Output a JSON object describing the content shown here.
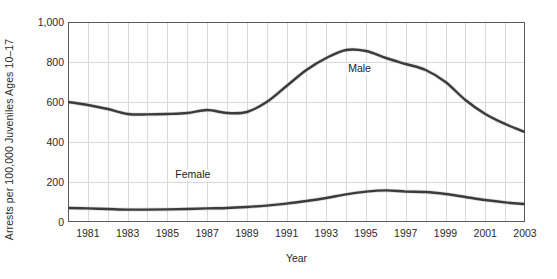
{
  "chart_data": {
    "type": "line",
    "title": "",
    "xlabel": "Year",
    "ylabel": "Arrests per 100,000 Juveniles Ages 10–17",
    "xlim": [
      1980,
      2003
    ],
    "ylim": [
      0,
      1000
    ],
    "yticks": [
      "0",
      "200",
      "400",
      "600",
      "800",
      "1,000"
    ],
    "ytick_values": [
      0,
      200,
      400,
      600,
      800,
      1000
    ],
    "xticks": [
      "1981",
      "1983",
      "1985",
      "1987",
      "1989",
      "1991",
      "1993",
      "1995",
      "1997",
      "1999",
      "2001",
      "2003"
    ],
    "xtick_values": [
      1981,
      1983,
      1985,
      1987,
      1989,
      1991,
      1993,
      1995,
      1997,
      1999,
      2001,
      2003
    ],
    "grid": true,
    "grid_color": "#d9d9dd",
    "line_color": "#3b3b3b",
    "legend_position": "inline-annotations",
    "x": [
      1980,
      1981,
      1982,
      1983,
      1984,
      1985,
      1986,
      1987,
      1988,
      1989,
      1990,
      1991,
      1992,
      1993,
      1994,
      1995,
      1996,
      1997,
      1998,
      1999,
      2000,
      2001,
      2002,
      2003
    ],
    "series": [
      {
        "name": "Male",
        "label": "Male",
        "values": [
          600,
          585,
          565,
          540,
          538,
          540,
          545,
          560,
          545,
          550,
          600,
          680,
          760,
          820,
          860,
          855,
          820,
          790,
          760,
          700,
          610,
          540,
          490,
          450
        ]
      },
      {
        "name": "Female",
        "label": "Female",
        "values": [
          70,
          68,
          65,
          62,
          62,
          63,
          65,
          68,
          70,
          75,
          82,
          92,
          105,
          120,
          138,
          152,
          158,
          152,
          150,
          140,
          125,
          110,
          98,
          90
        ]
      }
    ],
    "annotations": [
      {
        "text": "Male",
        "x": 1994.0,
        "y": 760
      },
      {
        "text": "Female",
        "x": 1985.3,
        "y": 230
      }
    ]
  }
}
